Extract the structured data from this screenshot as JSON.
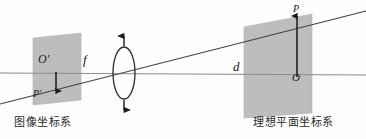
{
  "figure": {
    "type": "optics-geometry-diagram",
    "width": 366,
    "height": 139,
    "background_color": "#fdfdfd",
    "plane_fill_color": "#bdbdbd",
    "line_color": "#4a4a4a",
    "axis_color": "#8a8a8a",
    "text_color": "#1a1a1a"
  },
  "labels": {
    "o_prime": "O′",
    "p_prime": "P′",
    "focal_length": "f",
    "distance": "d",
    "p": "P",
    "o": "O"
  },
  "captions": {
    "left_plane": "图像坐标系",
    "right_plane": "理想平面坐标系"
  },
  "geometry": {
    "optical_axis": {
      "x1": 0,
      "y1": 73,
      "x2": 366,
      "y2": 75
    },
    "chief_ray": {
      "x1": 0,
      "y1": 104,
      "x2": 366,
      "y2": 11
    },
    "lens": {
      "cx": 124,
      "cy": 73,
      "rx": 11,
      "ry": 26
    },
    "lens_arrow_top": {
      "x": 124,
      "y1": 44,
      "y2": 33
    },
    "lens_arrow_bottom": {
      "x": 124,
      "y1": 102,
      "y2": 113
    },
    "image_plane": {
      "points": "33,38 81,33 81,100 33,105"
    },
    "ideal_plane": {
      "points": "244,27 312,14 312,113 244,118"
    },
    "image_point_arrow": {
      "x": 56,
      "y1": 72,
      "y2": 91
    },
    "ideal_point_arrow": {
      "x": 297,
      "y1": 77,
      "y2": 16
    }
  }
}
